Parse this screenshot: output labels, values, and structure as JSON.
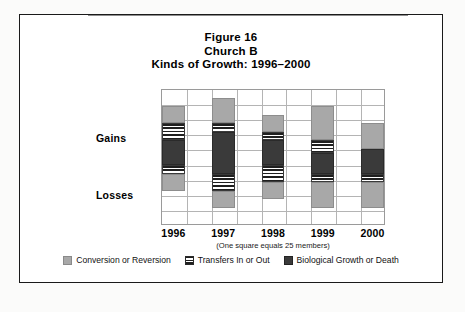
{
  "figure": {
    "title_line1": "Figure 16",
    "title_line2": "Church B",
    "title_line3": "Kinds of Growth: 1996–2000",
    "footnote": "(One square equals 25 members)"
  },
  "axis": {
    "y_positive_label": "Gains",
    "y_negative_label": "Losses"
  },
  "legend": {
    "items": [
      {
        "label": "Conversion or Reversion",
        "key": "conversion",
        "color": "#a8a8a8"
      },
      {
        "label": "Transfers In or Out",
        "key": "transfers",
        "color": "#1f1f1f"
      },
      {
        "label": "Biological Growth or Death",
        "key": "biological",
        "color": "#3a3a3a"
      }
    ]
  },
  "chart_data": {
    "type": "bar",
    "subtitle": "(One square equals 25 members)",
    "xlabel": "",
    "ylabel": "Gains / Losses",
    "categories": [
      "1996",
      "1997",
      "1998",
      "1999",
      "2000"
    ],
    "unit": "members",
    "square_equals": 25,
    "grid": true,
    "grid_rows": 9,
    "grid_cols": 9,
    "ylim": [
      -100,
      100
    ],
    "legend_position": "bottom",
    "stacked": true,
    "note": "Stacked segments are drawn in screen order from the top of each bar downward; values are in members, read as square-counts × 25.",
    "series": [
      {
        "name": "Conversion or Reversion",
        "key": "conversion",
        "color": "#a8a8a8"
      },
      {
        "name": "Transfers In or Out",
        "key": "transfers",
        "color": "#1f1f1f"
      },
      {
        "name": "Biological Growth or Death",
        "key": "biological",
        "color": "#3a3a3a"
      }
    ],
    "bars": [
      {
        "category": "1996",
        "top": 75,
        "bottom": -50,
        "segments": [
          {
            "key": "conversion",
            "from": 50,
            "to": 75,
            "members": 25
          },
          {
            "key": "transfers",
            "from": 25,
            "to": 50,
            "members": 25
          },
          {
            "key": "biological",
            "from": -12,
            "to": 25,
            "members": 37
          },
          {
            "key": "transfers",
            "from": -25,
            "to": -12,
            "members": 13
          },
          {
            "key": "conversion",
            "from": -50,
            "to": -25,
            "members": 25
          }
        ]
      },
      {
        "category": "1997",
        "top": 87,
        "bottom": -75,
        "segments": [
          {
            "key": "conversion",
            "from": 50,
            "to": 87,
            "members": 37
          },
          {
            "key": "transfers",
            "from": 37,
            "to": 50,
            "members": 13
          },
          {
            "key": "biological",
            "from": -25,
            "to": 37,
            "members": 62
          },
          {
            "key": "transfers",
            "from": -50,
            "to": -25,
            "members": 25
          },
          {
            "key": "conversion",
            "from": -75,
            "to": -50,
            "members": 25
          }
        ]
      },
      {
        "category": "1998",
        "top": 62,
        "bottom": -62,
        "segments": [
          {
            "key": "conversion",
            "from": 37,
            "to": 62,
            "members": 25
          },
          {
            "key": "transfers",
            "from": 25,
            "to": 37,
            "members": 12
          },
          {
            "key": "biological",
            "from": -12,
            "to": 25,
            "members": 37
          },
          {
            "key": "transfers",
            "from": -37,
            "to": -12,
            "members": 25
          },
          {
            "key": "conversion",
            "from": -62,
            "to": -37,
            "members": 25
          }
        ]
      },
      {
        "category": "1999",
        "top": 75,
        "bottom": -75,
        "segments": [
          {
            "key": "conversion",
            "from": 25,
            "to": 75,
            "members": 50
          },
          {
            "key": "transfers",
            "from": 6,
            "to": 25,
            "members": 19
          },
          {
            "key": "biological",
            "from": -25,
            "to": 6,
            "members": 31
          },
          {
            "key": "transfers",
            "from": -37,
            "to": -25,
            "members": 12
          },
          {
            "key": "conversion",
            "from": -75,
            "to": -37,
            "members": 38
          }
        ]
      },
      {
        "category": "2000",
        "top": 50,
        "bottom": -75,
        "segments": [
          {
            "key": "conversion",
            "from": 12,
            "to": 50,
            "members": 38
          },
          {
            "key": "biological",
            "from": -25,
            "to": 12,
            "members": 37
          },
          {
            "key": "transfers",
            "from": -37,
            "to": -25,
            "members": 12
          },
          {
            "key": "conversion",
            "from": -75,
            "to": -37,
            "members": 38
          }
        ]
      }
    ]
  }
}
